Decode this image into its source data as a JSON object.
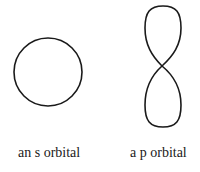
{
  "diagram": {
    "s_orbital": {
      "label": "an s orbital",
      "shape": "circle"
    },
    "p_orbital": {
      "label": "a p orbital",
      "shape": "dumbbell"
    },
    "stroke_color": "#1a1a1a",
    "background": "#ffffff"
  }
}
